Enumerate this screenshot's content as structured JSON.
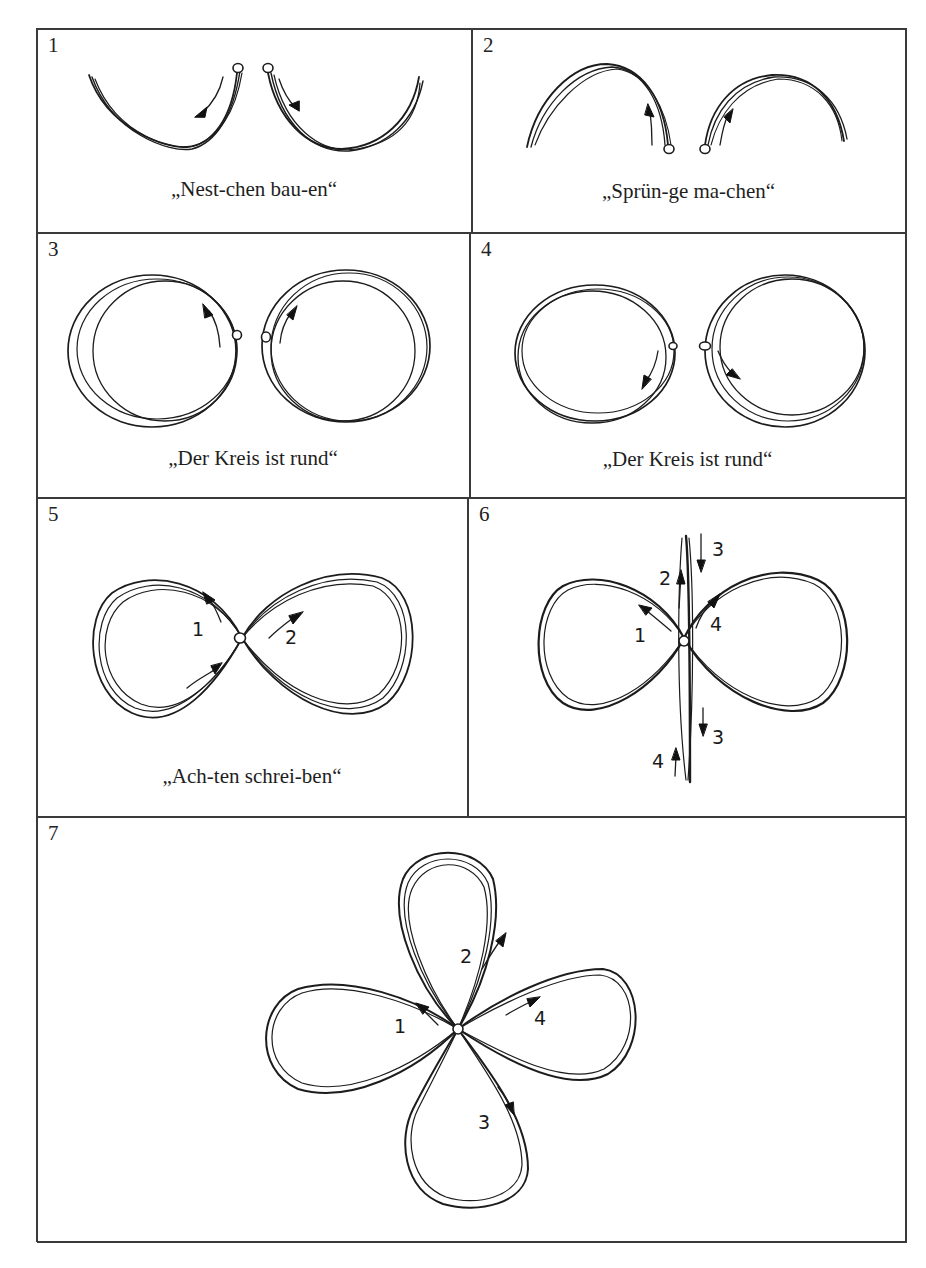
{
  "document": {
    "type": "handwriting-exercise-worksheet",
    "layout": "table grid, 2 columns x 3 rows + 1 full-width row"
  },
  "panels": [
    {
      "number": "1",
      "caption": "„Nest-chen bau-en“",
      "figure": "two downward arcs (nests) starting from dots at the center, arrows pointing down-outward"
    },
    {
      "number": "2",
      "caption": "„Sprün-ge ma-chen“",
      "figure": "two upward arcs (jumps) starting from dots at the bottom center, arrows pointing up"
    },
    {
      "number": "3",
      "caption": "„Der Kreis ist rund“",
      "figure": "two circles traced outward from dots at the center, arrows pointing upward"
    },
    {
      "number": "4",
      "caption": "„Der Kreis ist rund“",
      "figure": "two circles traced from dots at the center, arrows pointing downward"
    },
    {
      "number": "5",
      "caption": "„Ach-ten schrei-ben“",
      "figure": "horizontal figure eight with start dot at crossing",
      "stroke_labels": [
        "1",
        "2"
      ]
    },
    {
      "number": "6",
      "caption": "",
      "figure": "horizontal figure eight with vertical line through the crossing",
      "stroke_labels": [
        "1",
        "2",
        "3",
        "4",
        "3",
        "4"
      ]
    },
    {
      "number": "7",
      "caption": "",
      "figure": "four-leaf clover loop pattern with start dot at center",
      "stroke_labels": [
        "1",
        "2",
        "3",
        "4"
      ]
    }
  ],
  "colors": {
    "ink": "#1c1c1c",
    "grid": "#3a3a3a",
    "paper": "#ffffff"
  }
}
